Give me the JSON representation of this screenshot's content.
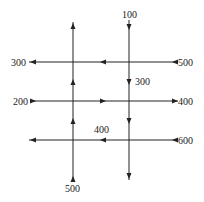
{
  "diagram": {
    "type": "traffic-flow-network",
    "labels": {
      "top_in": "100",
      "left_top_out": "300",
      "right_top_in": "500",
      "inner_right_vertical": "300",
      "left_middle_in": "200",
      "right_middle_out": "400",
      "inner_bottom_horizontal": "400",
      "right_bottom_in": "600",
      "bottom_in": "500"
    },
    "colors": {
      "line": "#222222",
      "background": "#ffffff"
    }
  }
}
